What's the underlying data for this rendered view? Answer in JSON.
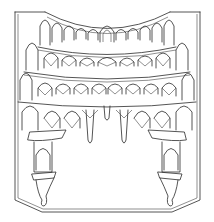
{
  "figure": {
    "stroke_color": "#2a2a2a",
    "background_color": "#ffffff",
    "tiers": 4,
    "top_row_arch_count": 13,
    "pendant_count": 4
  }
}
